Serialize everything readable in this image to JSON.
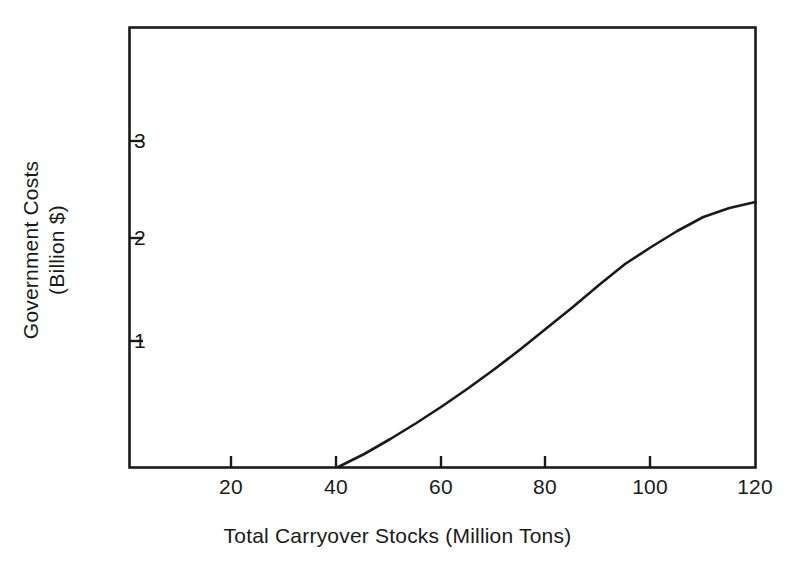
{
  "chart_data": {
    "type": "line",
    "title": "",
    "subtitle": "",
    "xlabel": "Total Carryover Stocks (Million Tons)",
    "ylabel_lines": [
      "Government Costs",
      "(Billion $)"
    ],
    "ylabel": "Government Costs (Billion $)",
    "xlim": [
      0,
      120
    ],
    "ylim": [
      -0.26,
      4.4
    ],
    "xticks": [
      20,
      40,
      60,
      80,
      100,
      120
    ],
    "xtick_labels": [
      "20",
      "40",
      "60",
      "80",
      "100",
      "120"
    ],
    "yticks": [
      1,
      2,
      3
    ],
    "ytick_labels": [
      "1",
      "2",
      "3"
    ],
    "grid": false,
    "legend": null,
    "series": [
      {
        "name": "Government Costs",
        "color": "#1a1a1a",
        "linewidth": 2.6,
        "x": [
          40,
          45,
          50,
          55,
          60,
          65,
          70,
          75,
          80,
          85,
          90,
          95,
          100,
          105,
          110,
          115,
          120
        ],
        "values": [
          0.0,
          0.13,
          0.28,
          0.44,
          0.61,
          0.79,
          0.98,
          1.18,
          1.39,
          1.6,
          1.82,
          2.03,
          2.2,
          2.36,
          2.5,
          2.59,
          2.65
        ]
      }
    ],
    "annotations": []
  },
  "axes": {
    "frame_color": "#1a1a1a",
    "background": "#ffffff",
    "tick_direction": "in"
  }
}
